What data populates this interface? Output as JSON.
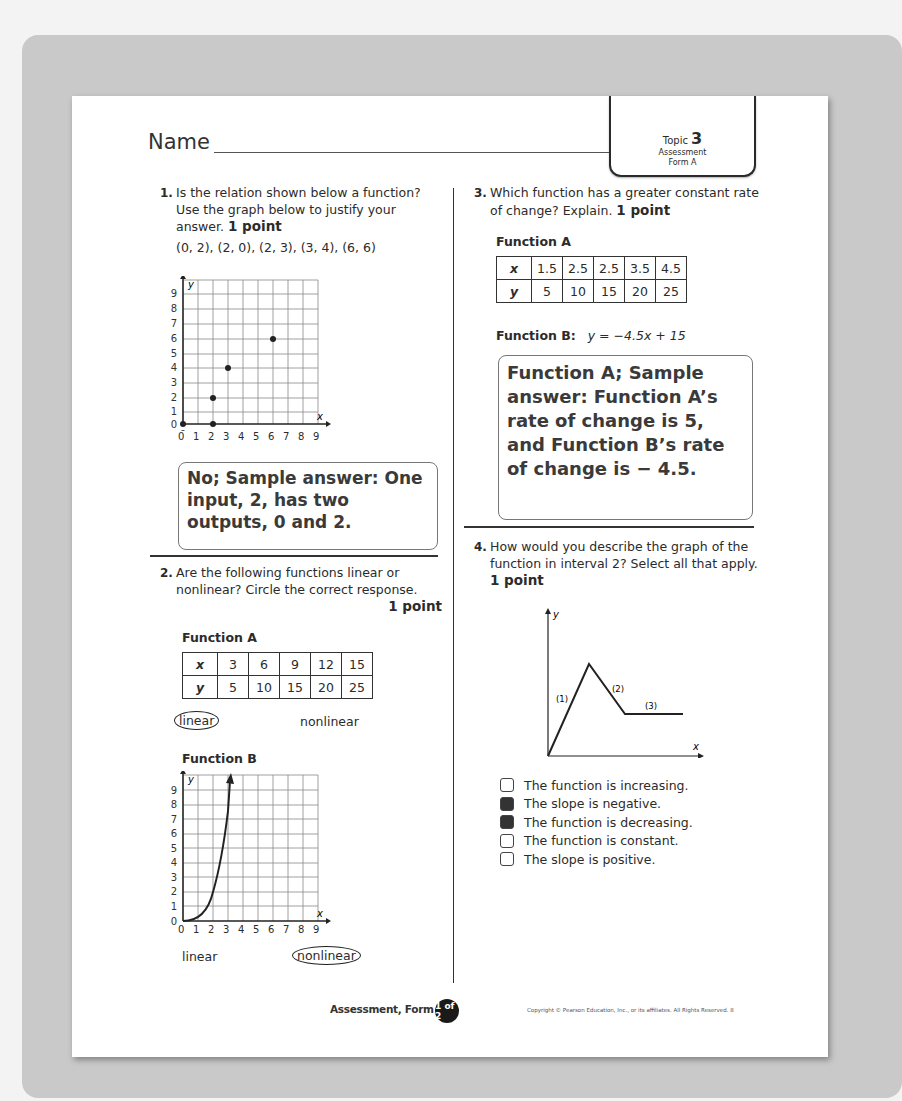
{
  "header": {
    "name_label": "Name",
    "topic_prefix": "Topic",
    "topic_number": "3",
    "tab_line1": "Assessment",
    "tab_line2": "Form A"
  },
  "q1": {
    "number": "1.",
    "text": "Is the relation shown below a function? Use the graph below to justify your answer.",
    "points": "1 point",
    "relation": "(0, 2), (2, 0), (2, 3), (3, 4), (6, 6)",
    "graph": {
      "x_label": "x",
      "y_label": "y",
      "x_ticks": [
        "0",
        "1",
        "2",
        "3",
        "4",
        "5",
        "6",
        "7",
        "8",
        "9"
      ],
      "y_ticks": [
        "0",
        "1",
        "2",
        "3",
        "4",
        "5",
        "6",
        "7",
        "8",
        "9"
      ],
      "points": [
        [
          0,
          0
        ],
        [
          2,
          0
        ],
        [
          2,
          2
        ],
        [
          3,
          4
        ],
        [
          6,
          6
        ]
      ]
    },
    "answer": "No; Sample answer: One input, 2, has two outputs, 0 and 2."
  },
  "q2": {
    "number": "2.",
    "text": "Are the following functions linear or nonlinear? Circle the correct response.",
    "points": "1 point",
    "function_a": {
      "title": "Function A",
      "x_header": "x",
      "y_header": "y",
      "x_values": [
        "3",
        "6",
        "9",
        "12",
        "15"
      ],
      "y_values": [
        "5",
        "10",
        "15",
        "20",
        "25"
      ],
      "option_linear": "linear",
      "option_nonlinear": "nonlinear",
      "selected": "linear"
    },
    "function_b": {
      "title": "Function B",
      "x_label": "x",
      "y_label": "y",
      "x_ticks": [
        "0",
        "1",
        "2",
        "3",
        "4",
        "5",
        "6",
        "7",
        "8",
        "9"
      ],
      "y_ticks": [
        "0",
        "1",
        "2",
        "3",
        "4",
        "5",
        "6",
        "7",
        "8",
        "9"
      ],
      "curve": "y = x^2 (from 0 to 3)",
      "option_linear": "linear",
      "option_nonlinear": "nonlinear",
      "selected": "nonlinear"
    }
  },
  "q3": {
    "number": "3.",
    "text": "Which function has a greater constant rate of change? Explain.",
    "points": "1 point",
    "function_a": {
      "title": "Function A",
      "x_header": "x",
      "y_header": "y",
      "x_values": [
        "1.5",
        "2.5",
        "2.5",
        "3.5",
        "4.5"
      ],
      "y_values": [
        "5",
        "10",
        "15",
        "20",
        "25"
      ]
    },
    "function_b_label": "Function B:",
    "function_b_equation": "y = −4.5x + 15",
    "answer": "Function A; Sample answer: Function A’s rate of change is 5, and Function B’s rate of change is  − 4.5."
  },
  "q4": {
    "number": "4.",
    "text": "How would you describe the graph of the function in interval 2? Select all that apply.",
    "points": "1 point",
    "graph": {
      "x_label": "x",
      "y_label": "y",
      "interval_labels": [
        "(1)",
        "(2)",
        "(3)"
      ]
    },
    "options": [
      {
        "label": "The function is increasing.",
        "checked": false
      },
      {
        "label": "The slope is negative.",
        "checked": true
      },
      {
        "label": "The function is decreasing.",
        "checked": true
      },
      {
        "label": "The function is constant.",
        "checked": false
      },
      {
        "label": "The slope is positive.",
        "checked": false
      }
    ]
  },
  "footer": {
    "form_label": "Assessment, Form A",
    "page_badge": "1 of 2",
    "copyright": "Copyright © Pearson Education, Inc., or its affiliates. All Rights Reserved. 8"
  },
  "colors": {
    "page": "#ffffff",
    "frame": "#c9c9c9",
    "ink": "#2b2b2b",
    "checked_box": "#333333"
  }
}
